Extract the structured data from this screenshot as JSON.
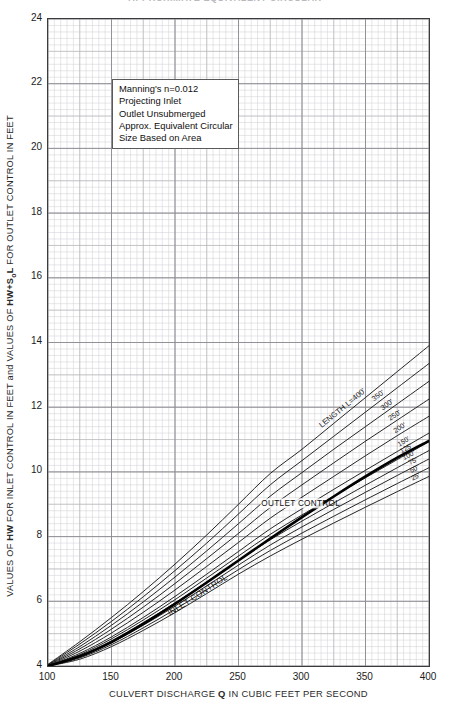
{
  "title": "APPROXIMATE EQUIVALENT CIRCULAR",
  "note_box": {
    "lines": [
      "Manning's n=0.012",
      "Projecting Inlet",
      "Outlet Unsubmerged",
      "Approx. Equivalent Circular",
      "Size Based on Area"
    ]
  },
  "annotations": {
    "outlet_control": "OUTLET CONTROL",
    "inlet_control": "INLET CONTROL",
    "length_lead": "LENGTH L=400'"
  },
  "colors": {
    "curve": "#1a1a1a",
    "inlet_curve": "#000000",
    "grid_minor": "#cfcfd4",
    "grid_major": "#8b8b91",
    "axis": "#3b3b3b",
    "text": "#1c1c1c"
  },
  "chart_data": {
    "type": "line",
    "title": "APPROXIMATE EQUIVALENT CIRCULAR",
    "xlabel": "CULVERT DISCHARGE Q IN CUBIC FEET PER SECOND",
    "ylabel": "VALUES OF HW FOR INLET CONTROL IN FEET and VALUES OF HW+S0L FOR OUTLET CONTROL IN FEET",
    "xlim": [
      100,
      400
    ],
    "ylim": [
      4,
      24
    ],
    "xticks": [
      100,
      150,
      200,
      250,
      300,
      350,
      400
    ],
    "yticks": [
      4,
      6,
      8,
      10,
      12,
      14,
      16,
      18,
      20,
      22,
      24
    ],
    "grid": "minor-and-major",
    "legend": "inline-curve-labels",
    "x": [
      100,
      125,
      150,
      175,
      200,
      225,
      250,
      275,
      300,
      325,
      350,
      375,
      400
    ],
    "series": [
      {
        "name": "LENGTH L=400'",
        "label": "LENGTH L=400'",
        "values": [
          4.05,
          4.75,
          5.5,
          6.3,
          7.15,
          8.05,
          9.0,
          9.95,
          10.7,
          11.5,
          12.3,
          13.1,
          13.9
        ]
      },
      {
        "name": "350'",
        "label": "350'",
        "values": [
          4.04,
          4.68,
          5.38,
          6.14,
          6.95,
          7.8,
          8.7,
          9.6,
          10.35,
          11.1,
          11.85,
          12.6,
          13.35
        ]
      },
      {
        "name": "300'",
        "label": "300'",
        "values": [
          4.03,
          4.6,
          5.26,
          5.98,
          6.75,
          7.56,
          8.4,
          9.25,
          9.98,
          10.7,
          11.4,
          12.1,
          12.8
        ]
      },
      {
        "name": "250'",
        "label": "250'",
        "values": [
          4.02,
          4.53,
          5.14,
          5.82,
          6.55,
          7.32,
          8.1,
          8.9,
          9.6,
          10.28,
          10.95,
          11.6,
          12.25
        ]
      },
      {
        "name": "200'",
        "label": "200'",
        "values": [
          4.01,
          4.46,
          5.02,
          5.66,
          6.35,
          7.08,
          7.82,
          8.57,
          9.22,
          9.86,
          10.5,
          11.12,
          11.72
        ]
      },
      {
        "name": "150'",
        "label": "150'",
        "values": [
          4.0,
          4.39,
          4.9,
          5.5,
          6.15,
          6.84,
          7.54,
          8.24,
          8.86,
          9.46,
          10.05,
          10.63,
          11.2
        ]
      },
      {
        "name": "125'",
        "label": "125'",
        "values": [
          4.0,
          4.35,
          4.84,
          5.42,
          6.05,
          6.72,
          7.4,
          8.07,
          8.67,
          9.25,
          9.82,
          10.38,
          10.93
        ]
      },
      {
        "name": "100'",
        "label": "100'",
        "values": [
          4.0,
          4.32,
          4.78,
          5.34,
          5.95,
          6.6,
          7.26,
          7.9,
          8.48,
          9.04,
          9.59,
          10.13,
          10.66
        ]
      },
      {
        "name": "75'",
        "label": "75'",
        "values": [
          4.0,
          4.28,
          4.72,
          5.26,
          5.85,
          6.48,
          7.12,
          7.74,
          8.3,
          8.84,
          9.37,
          9.89,
          10.4
        ]
      },
      {
        "name": "50'",
        "label": "50'",
        "values": [
          4.0,
          4.25,
          4.66,
          5.18,
          5.75,
          6.36,
          6.98,
          7.57,
          8.11,
          8.63,
          9.14,
          9.64,
          10.13
        ]
      },
      {
        "name": "25'",
        "label": "25'",
        "values": [
          4.0,
          4.21,
          4.6,
          5.1,
          5.65,
          6.24,
          6.84,
          7.4,
          7.92,
          8.42,
          8.91,
          9.39,
          9.86
        ]
      },
      {
        "name": "INLET CONTROL",
        "label": "INLET CONTROL",
        "emphasis": "bold",
        "values": [
          4.0,
          4.3,
          4.74,
          5.3,
          5.92,
          6.58,
          7.26,
          7.94,
          8.6,
          9.24,
          9.86,
          10.44,
          10.96
        ]
      }
    ]
  }
}
